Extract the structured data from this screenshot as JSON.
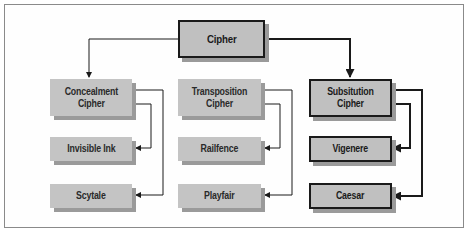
{
  "diagram": {
    "nodes": {
      "cipher": {
        "label": "Cipher"
      },
      "concealment": {
        "label": "Concealment\nCipher"
      },
      "transposition": {
        "label": "Transposition\nCipher"
      },
      "substitution": {
        "label": "Subsitution\nCipher"
      },
      "invisible_ink": {
        "label": "Invisible Ink"
      },
      "railfence": {
        "label": "Railfence"
      },
      "vigenere": {
        "label": "Vigenere"
      },
      "scytale": {
        "label": "Scytale"
      },
      "playfair": {
        "label": "Playfair"
      },
      "caesar": {
        "label": "Caesar"
      }
    },
    "edges": [
      {
        "from": "cipher",
        "to": "concealment",
        "style": "thin"
      },
      {
        "from": "cipher",
        "to": "substitution",
        "style": "thick"
      },
      {
        "from": "concealment",
        "to": "invisible_ink",
        "style": "thin"
      },
      {
        "from": "concealment",
        "to": "scytale",
        "style": "thin"
      },
      {
        "from": "transposition",
        "to": "railfence",
        "style": "thin"
      },
      {
        "from": "transposition",
        "to": "playfair",
        "style": "thin"
      },
      {
        "from": "substitution",
        "to": "vigenere",
        "style": "thick"
      },
      {
        "from": "substitution",
        "to": "caesar",
        "style": "thick"
      }
    ],
    "colors": {
      "box_fill": "#c4c4c4",
      "shadow": "#9a9a9a",
      "line": "#1a1a1a",
      "frame": "#8a8a8a"
    }
  }
}
